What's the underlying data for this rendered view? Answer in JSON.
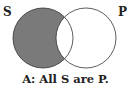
{
  "diagram": {
    "type": "venn",
    "labels": {
      "left": "S",
      "right": "P"
    },
    "caption": "A: All S are P.",
    "shaded_region": "S outside P",
    "colors": {
      "shade": "#7a7a7a",
      "stroke": "#333333"
    }
  }
}
